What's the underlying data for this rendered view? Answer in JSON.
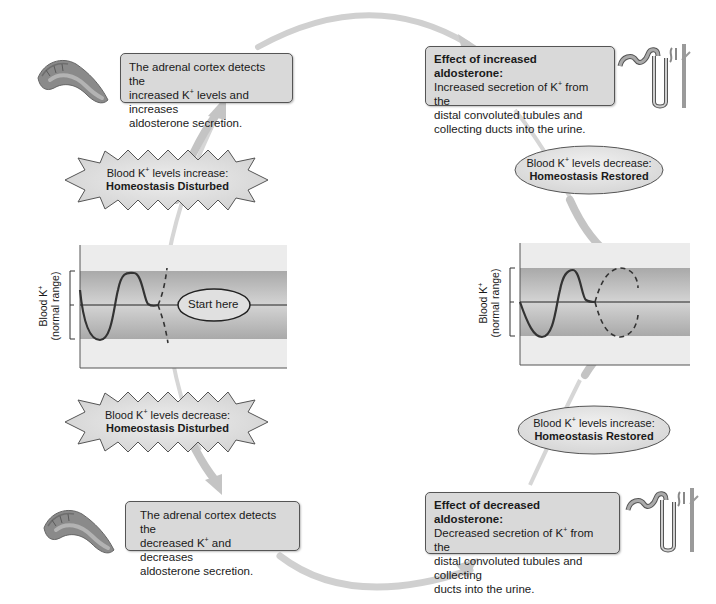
{
  "diagram": {
    "topic": "Aldosterone regulation of blood K+ (negative feedback)",
    "colors": {
      "box_fill": "#d9d9d9",
      "box_border": "#555555",
      "arrow": "#cccccc",
      "band_outer": "#ececec",
      "band_inner": "#b9b9b9",
      "curve": "#333333"
    },
    "top_left_box": {
      "line1": "The adrenal cortex detects the",
      "line2_pre": "increased K",
      "line2_sup": "+",
      "line2_post": " levels and increases",
      "line3": "aldosterone secretion."
    },
    "top_right_box": {
      "title": "Effect of increased aldosterone:",
      "line1_pre": "Increased secretion of K",
      "line1_sup": "+",
      "line1_post": " from the",
      "line2": "distal convoluted tubules and",
      "line3": "collecting ducts into the urine."
    },
    "bottom_left_box": {
      "line1": "The adrenal cortex detects the",
      "line2_pre": "decreased K",
      "line2_sup": "+",
      "line2_post": " and decreases",
      "line3": "aldosterone secretion."
    },
    "bottom_right_box": {
      "title": "Effect of decreased aldosterone:",
      "line1_pre": "Decreased secretion of K",
      "line1_sup": "+",
      "line1_post": " from the",
      "line2": "distal convoluted tubules and collecting",
      "line3": "ducts into the urine."
    },
    "burst_increase": {
      "line1_pre": "Blood K",
      "line1_sup": "+",
      "line1_post": " levels increase:",
      "line2": "Homeostasis Disturbed"
    },
    "burst_decrease": {
      "line1_pre": "Blood K",
      "line1_sup": "+",
      "line1_post": " levels decrease:",
      "line2": "Homeostasis Disturbed"
    },
    "ellipse_decrease": {
      "line1_pre": "Blood K",
      "line1_sup": "+",
      "line1_post": " levels decrease:",
      "line2": "Homeostasis Restored"
    },
    "ellipse_increase": {
      "line1_pre": "Blood K",
      "line1_sup": "+",
      "line1_post": " levels increase:",
      "line2": "Homeostasis Restored"
    },
    "left_graph": {
      "ylabel_line1_pre": "Blood K",
      "ylabel_line1_sup": "+",
      "ylabel_line2": "(normal range)",
      "start_label": "Start here"
    },
    "right_graph": {
      "ylabel_line1_pre": "Blood K",
      "ylabel_line1_sup": "+",
      "ylabel_line2": "(normal range)"
    },
    "icons": [
      "adrenal-gland-icon",
      "nephron-icon"
    ]
  }
}
